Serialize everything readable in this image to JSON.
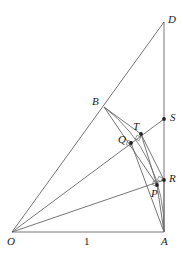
{
  "figure": {
    "width": 183,
    "height": 257,
    "background_color": "#ffffff",
    "stroke_color": "#555555",
    "dot_color": "#222222",
    "label_color": "#1a1a1a"
  },
  "points": [
    {
      "id": "O",
      "label": "O",
      "x": 12,
      "y": 232,
      "label_x": 7,
      "label_y": 236,
      "dot": false
    },
    {
      "id": "A",
      "label": "A",
      "x": 164,
      "y": 232,
      "label_x": 161,
      "label_y": 236,
      "dot": false
    },
    {
      "id": "D",
      "label": "D",
      "x": 164,
      "y": 22,
      "label_x": 168,
      "label_y": 14,
      "dot": false
    },
    {
      "id": "B",
      "label": "B",
      "x": 104,
      "y": 107,
      "label_x": 92,
      "label_y": 96,
      "dot": false
    },
    {
      "id": "S",
      "label": "S",
      "x": 164,
      "y": 119,
      "label_x": 170,
      "label_y": 112,
      "dot": true
    },
    {
      "id": "T",
      "label": "T",
      "x": 141,
      "y": 134,
      "label_x": 133,
      "label_y": 121,
      "dot": true
    },
    {
      "id": "Q",
      "label": "Q",
      "x": 131,
      "y": 143,
      "label_x": 118,
      "label_y": 134,
      "dot": true
    },
    {
      "id": "R",
      "label": "R",
      "x": 164,
      "y": 180,
      "label_x": 169,
      "label_y": 173,
      "dot": true
    },
    {
      "id": "P",
      "label": "P",
      "x": 157,
      "y": 185,
      "label_x": 151,
      "label_y": 188,
      "dot": true
    }
  ],
  "measurements": [
    {
      "id": "unit-length",
      "label": "1",
      "x": 84,
      "y": 236
    }
  ],
  "segments": [
    {
      "id": "base-OA",
      "from": "O",
      "to": "A"
    },
    {
      "id": "vertical-AD",
      "from": "A",
      "to": "D"
    },
    {
      "id": "ray-OD",
      "from": "O",
      "to": "D"
    },
    {
      "id": "ray-OS",
      "from": "O",
      "to": "S"
    },
    {
      "id": "ray-OR",
      "from": "O",
      "to": "R"
    },
    {
      "id": "chord-BP",
      "from": "B",
      "to": "P"
    },
    {
      "id": "chord-BT",
      "from": "B",
      "to": "T"
    },
    {
      "id": "chord-TP",
      "from": "T",
      "to": "P"
    },
    {
      "id": "chord-TR",
      "from": "T",
      "to": "R"
    },
    {
      "id": "chord-QA",
      "from": "Q",
      "to": "A"
    },
    {
      "id": "chord-PA",
      "from": "P",
      "to": "A"
    },
    {
      "id": "chord-RA",
      "from": "R",
      "to": "A"
    }
  ],
  "arcs": [
    {
      "id": "unit-arc-BA",
      "description": "circular arc of radius OA centred at O, from B through Q and P to A"
    }
  ],
  "right_angle_marks": [
    {
      "id": "right-angle-at-Q",
      "x": 131,
      "y": 143
    },
    {
      "id": "right-angle-at-P",
      "x": 157,
      "y": 185
    }
  ]
}
